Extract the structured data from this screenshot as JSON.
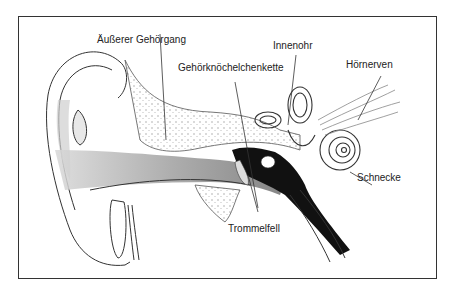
{
  "diagram": {
    "labels": {
      "outer_canal": "Äußerer Gehörgang",
      "ossicles": "Gehörknöchelchenkette",
      "inner_ear": "Innenohr",
      "auditory_nerve": "Hörnerven",
      "cochlea": "Schnecke",
      "eardrum": "Trommelfell"
    },
    "colors": {
      "line": "#333333",
      "shade": "#9a9a9a",
      "dark": "#111111",
      "border": "#333333"
    }
  }
}
